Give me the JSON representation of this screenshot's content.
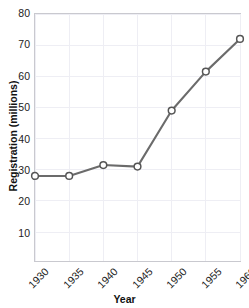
{
  "chart_data": {
    "type": "line",
    "title": "",
    "xlabel": "Year",
    "ylabel": "Registration (millions)",
    "x": [
      1930,
      1935,
      1940,
      1945,
      1950,
      1955,
      1960
    ],
    "categories": [
      "1930",
      "1935",
      "1940",
      "1945",
      "1950",
      "1955",
      "1960"
    ],
    "values": [
      28,
      28,
      31.5,
      31,
      49,
      61.5,
      72
    ],
    "series": [
      {
        "name": "Registration",
        "values": [
          28,
          28,
          31.5,
          31,
          49,
          61.5,
          72
        ]
      }
    ],
    "xlim": [
      1930,
      1960
    ],
    "ylim": [
      0.7,
      80
    ],
    "yticks": [
      10,
      20,
      30,
      40,
      50,
      60,
      70,
      80
    ],
    "ytick_labels": [
      "10",
      "20",
      "30",
      "40",
      "50",
      "60",
      "70",
      "80"
    ],
    "xticks": [
      1930,
      1935,
      1940,
      1945,
      1950,
      1955,
      1960
    ],
    "xtick_labels": [
      "1930",
      "1935",
      "1940",
      "1945",
      "1950",
      "1955",
      "1960"
    ],
    "grid": true,
    "legend": false,
    "marker": "open-circle",
    "line_color": "#6b6b6b",
    "marker_fill": "#ffffff",
    "marker_edge_color": "#555555",
    "grid_color": "#eeeef4",
    "axes_color": "#c9c9cf",
    "xtick_rotation": -45
  }
}
